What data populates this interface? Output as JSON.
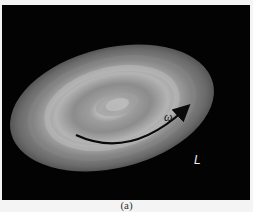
{
  "figure": {
    "caption": "(a)",
    "background_color": "#030303",
    "page_color": "#f4f4f4",
    "disk": {
      "description": "rotating flattened disk with concentric brightness bands",
      "center": [
        112,
        108
      ],
      "rx": 104,
      "ry": 60,
      "rotation_deg": -14
    },
    "labels": {
      "omega": "ω",
      "L": "L"
    },
    "arrow": {
      "meaning": "rotation direction",
      "color": "#0a0a0a"
    }
  }
}
